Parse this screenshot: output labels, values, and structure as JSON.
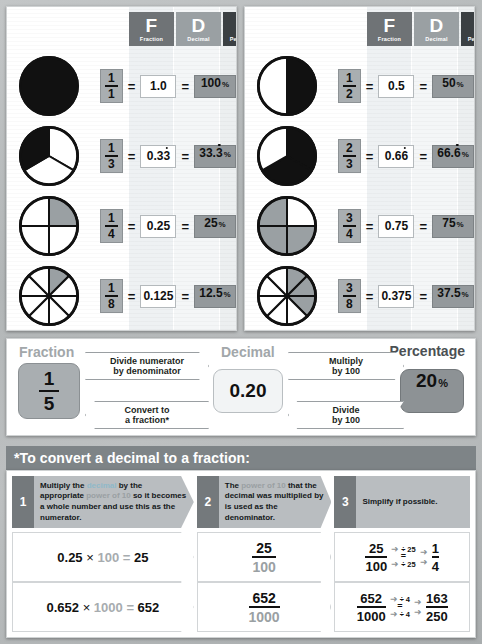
{
  "headers": {
    "f": {
      "big": "F",
      "small": "Fraction"
    },
    "d": {
      "big": "D",
      "small": "Decimal"
    },
    "p": {
      "big": "P",
      "small": "Percentage"
    }
  },
  "watermarks": [
    "1/8",
    "3/4",
    "1/2"
  ],
  "panel_left": {
    "rows": [
      {
        "shaded": 1,
        "parts": 1,
        "num": "1",
        "den": "1",
        "decimal": "1.0",
        "percent": "100",
        "pct_sign": "%",
        "repeating": false,
        "fill": "dark"
      },
      {
        "shaded": 1,
        "parts": 3,
        "num": "1",
        "den": "3",
        "decimal": "0.33",
        "percent": "33.3",
        "pct_sign": "%",
        "repeating": true,
        "fill": "dark"
      },
      {
        "shaded": 1,
        "parts": 4,
        "num": "1",
        "den": "4",
        "decimal": "0.25",
        "percent": "25",
        "pct_sign": "%",
        "repeating": false,
        "fill": "grey"
      },
      {
        "shaded": 1,
        "parts": 8,
        "num": "1",
        "den": "8",
        "decimal": "0.125",
        "percent": "12.5",
        "pct_sign": "%",
        "repeating": false,
        "fill": "grey"
      }
    ]
  },
  "panel_right": {
    "rows": [
      {
        "shaded": 1,
        "parts": 2,
        "num": "1",
        "den": "2",
        "decimal": "0.5",
        "percent": "50",
        "pct_sign": "%",
        "repeating": false,
        "fill": "dark"
      },
      {
        "shaded": 2,
        "parts": 3,
        "num": "2",
        "den": "3",
        "decimal": "0.66",
        "percent": "66.6",
        "pct_sign": "%",
        "repeating": true,
        "fill": "dark"
      },
      {
        "shaded": 3,
        "parts": 4,
        "num": "3",
        "den": "4",
        "decimal": "0.75",
        "percent": "75",
        "pct_sign": "%",
        "repeating": false,
        "fill": "grey"
      },
      {
        "shaded": 3,
        "parts": 8,
        "num": "3",
        "den": "8",
        "decimal": "0.375",
        "percent": "37.5",
        "pct_sign": "%",
        "repeating": false,
        "fill": "grey"
      }
    ]
  },
  "converter": {
    "label_fraction": "Fraction",
    "label_decimal": "Decimal",
    "label_percentage": "Percentage",
    "fraction_num": "1",
    "fraction_den": "5",
    "decimal_value": "0.20",
    "percent_value": "20",
    "percent_sign": "%",
    "arrow_top_left_l1": "Divide numerator",
    "arrow_top_left_l2": "by denominator",
    "arrow_bottom_left_l1": "Convert to",
    "arrow_bottom_left_l2": "a fraction*",
    "arrow_top_right_l1": "Multiply",
    "arrow_top_right_l2": "by 100",
    "arrow_bottom_right_l1": "Divide",
    "arrow_bottom_right_l2": "by 100"
  },
  "bottom": {
    "title": "*To convert a decimal to a fraction:",
    "steps": [
      {
        "num": "1",
        "parts": [
          {
            "t": "Multiply the ",
            "c": "plain"
          },
          {
            "t": "decimal",
            "c": "teal"
          },
          {
            "t": " by the appropriate ",
            "c": "plain"
          },
          {
            "t": "power of 10",
            "c": "grey"
          },
          {
            "t": " so it becomes a whole number and use this as the ",
            "c": "plain"
          },
          {
            "t": "numerator",
            "c": "plain"
          },
          {
            "t": ".",
            "c": "plain"
          }
        ]
      },
      {
        "num": "2",
        "parts": [
          {
            "t": "The ",
            "c": "plain"
          },
          {
            "t": "power of 10",
            "c": "grey"
          },
          {
            "t": " that the decimal was multiplied by is used as the ",
            "c": "plain"
          },
          {
            "t": "denominator",
            "c": "plain"
          },
          {
            "t": ".",
            "c": "plain"
          }
        ]
      },
      {
        "num": "3",
        "parts": [
          {
            "t": "Simplify if possible.",
            "c": "plain"
          }
        ]
      }
    ],
    "examples": [
      {
        "calc_decimal": "0.25",
        "calc_times": "×",
        "calc_power": "100",
        "calc_equals": "=",
        "calc_result": "25",
        "frac_num": "25",
        "frac_den": "100",
        "simp_from_num": "25",
        "simp_from_den": "100",
        "divide_top": "÷ 25",
        "divide_bottom": "÷ 25",
        "simp_to_num": "1",
        "simp_to_den": "4",
        "arrow": "➜",
        "equals": "="
      },
      {
        "calc_decimal": "0.652",
        "calc_times": "×",
        "calc_power": "1000",
        "calc_equals": "=",
        "calc_result": "652",
        "frac_num": "652",
        "frac_den": "1000",
        "simp_from_num": "652",
        "simp_from_den": "1000",
        "divide_top": "÷ 4",
        "divide_bottom": "÷ 4",
        "simp_to_num": "163",
        "simp_to_den": "250",
        "arrow": "➜",
        "equals": "="
      }
    ]
  }
}
